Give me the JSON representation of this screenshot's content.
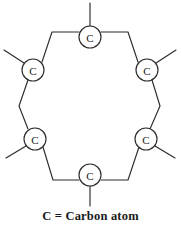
{
  "figure": {
    "background_color": "#ffffff",
    "line_color": "#2b2b2b",
    "text_color": "#1a1a1a"
  },
  "diagram": {
    "type": "hexagonal-carbon-ring",
    "atom_count": 6,
    "atoms": [
      {
        "id": "top",
        "label": "C",
        "cx": 90,
        "cy": 37,
        "r": 11
      },
      {
        "id": "upper-left",
        "label": "C",
        "cx": 33,
        "cy": 70,
        "r": 11
      },
      {
        "id": "upper-right",
        "label": "C",
        "cx": 147,
        "cy": 70,
        "r": 11
      },
      {
        "id": "lower-left",
        "label": "C",
        "cx": 35,
        "cy": 139,
        "r": 11
      },
      {
        "id": "lower-right",
        "label": "C",
        "cx": 146,
        "cy": 139,
        "r": 11
      },
      {
        "id": "bottom",
        "label": "C",
        "cx": 90,
        "cy": 175,
        "r": 11
      }
    ],
    "ring_bonds": [
      {
        "from": "upper-left",
        "to": "top",
        "path": "M 42 62 L 52 32 L 79 32"
      },
      {
        "from": "top",
        "to": "upper-right",
        "path": "M 101 32 L 128 32 L 138 62"
      },
      {
        "from": "upper-right",
        "to": "lower-right",
        "path": "M 152 80 L 160 106 L 150 129"
      },
      {
        "from": "lower-right",
        "to": "bottom",
        "path": "M 139 147 L 128 180 L 101 180"
      },
      {
        "from": "bottom",
        "to": "lower-left",
        "path": "M 79 180 L 53 180 L 43 147"
      },
      {
        "from": "lower-left",
        "to": "upper-left",
        "path": "M 28 129 L 19 106 L 28 80"
      }
    ],
    "substituent_bonds": [
      {
        "atom": "top",
        "direction": "up",
        "path": "M 90 26 L 90 3"
      },
      {
        "atom": "bottom",
        "direction": "down",
        "path": "M 90 186 L 90 206"
      },
      {
        "atom": "upper-left",
        "direction": "up-left",
        "path": "M 24 63 L 4 50"
      },
      {
        "atom": "upper-right",
        "direction": "up-right",
        "path": "M 156 63 L 176 50"
      },
      {
        "atom": "lower-left",
        "direction": "down-left",
        "path": "M 26 146 L 6 158"
      },
      {
        "atom": "lower-right",
        "direction": "down-right",
        "path": "M 155 146 L 175 158"
      }
    ]
  },
  "legend": {
    "text": "C = Carbon atom",
    "symbol": "C",
    "meaning": "Carbon atom"
  }
}
